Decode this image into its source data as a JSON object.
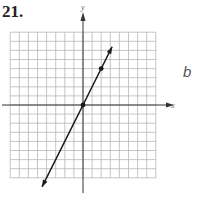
{
  "problem": {
    "number": "21.",
    "side_label": "b"
  },
  "axes": {
    "x_label": "x",
    "y_label": "y"
  },
  "colors": {
    "grid": "#b8b8b8",
    "axis": "#333333",
    "line": "#1a1a1a"
  },
  "chart_data": {
    "type": "line",
    "title": "",
    "xlabel": "x",
    "ylabel": "y",
    "xlim": [
      -8,
      8
    ],
    "ylim": [
      -8,
      8
    ],
    "grid": true,
    "series": [
      {
        "name": "y = 2x",
        "x": [
          -4.5,
          3.2
        ],
        "y": [
          -9,
          6.4
        ]
      }
    ],
    "points": [
      {
        "x": 0,
        "y": 0
      },
      {
        "x": 2,
        "y": 4
      }
    ],
    "equation": "y = 2x"
  }
}
